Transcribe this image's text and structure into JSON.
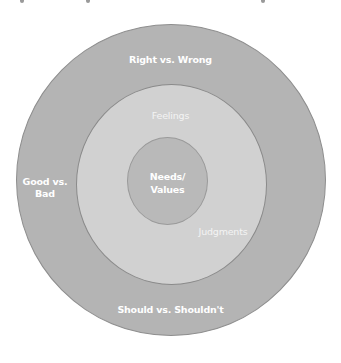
{
  "diagram": {
    "type": "concentric-circles",
    "rings": [
      {
        "id": "outer",
        "color": "#b4b4b4",
        "labels": {
          "top": "Right vs. Wrong",
          "left_line1": "Good vs.",
          "left_line2": "Bad",
          "bottom": "Should vs. Shouldn't"
        }
      },
      {
        "id": "middle",
        "color": "#d1d1d1",
        "labels": {
          "top": "Feelings",
          "bottom_right": "Judgments"
        }
      },
      {
        "id": "inner",
        "color": "#b9b9b9",
        "labels": {
          "line1": "Needs/",
          "line2": "Values"
        }
      }
    ],
    "label_color": "#ffffff"
  }
}
